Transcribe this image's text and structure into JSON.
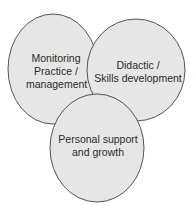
{
  "diagram": {
    "type": "venn",
    "colors": {
      "fill": "#e6e6e6",
      "stroke": "#555555",
      "text": "#2a2a2a",
      "background": "#ffffff"
    },
    "circles": [
      {
        "id": "monitoring",
        "lines": [
          "Monitoring",
          "Practice /",
          "management"
        ],
        "cx": 53,
        "cy": 69,
        "rx": 45,
        "ry": 55
      },
      {
        "id": "didactic",
        "lines": [
          "Didactic /",
          "Skills development"
        ],
        "cx": 136,
        "cy": 70,
        "rx": 49,
        "ry": 51
      },
      {
        "id": "personal",
        "lines": [
          "Personal support",
          "and growth"
        ],
        "cx": 97,
        "cy": 148,
        "rx": 47,
        "ry": 54
      }
    ]
  }
}
